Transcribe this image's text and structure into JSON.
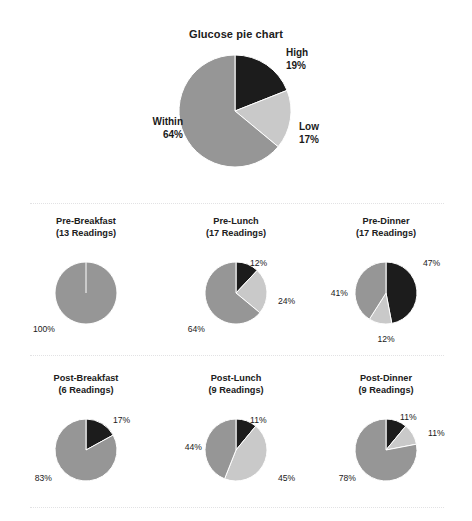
{
  "report": {
    "title": "Glucose pie chart",
    "background_color": "#ffffff",
    "divider_color": "#e2e2e4"
  },
  "palette": {
    "high": "#1c1c1c",
    "low": "#c9c9c9",
    "within": "#969696",
    "gap": "#ffffff",
    "text": "#1a1a1a"
  },
  "chart_data": [
    {
      "type": "pie",
      "id": "main",
      "title": "Glucose pie chart",
      "labels": [
        "High",
        "Low",
        "Within"
      ],
      "values": [
        19,
        17,
        64
      ],
      "value_labels": [
        "19%",
        "17%",
        "64%"
      ],
      "colors": [
        "#1c1c1c",
        "#c9c9c9",
        "#969696"
      ],
      "start_angle": 0,
      "direction": "clockwise",
      "legend": "none",
      "label_text": {
        "high": "High\n19%",
        "low": "Low\n17%",
        "within": "Within\n64%"
      }
    },
    {
      "type": "pie",
      "id": "pre-breakfast",
      "title": "Pre-Breakfast",
      "subtitle": "(13 Readings)",
      "readings": 13,
      "labels": [
        "High",
        "Low",
        "Within"
      ],
      "values": [
        0,
        0,
        100
      ],
      "value_labels": [
        "",
        "",
        "100%"
      ],
      "colors": [
        "#1c1c1c",
        "#c9c9c9",
        "#969696"
      ],
      "start_angle": 0,
      "direction": "clockwise"
    },
    {
      "type": "pie",
      "id": "pre-lunch",
      "title": "Pre-Lunch",
      "subtitle": "(17 Readings)",
      "readings": 17,
      "labels": [
        "High",
        "Low",
        "Within"
      ],
      "values": [
        12,
        24,
        64
      ],
      "value_labels": [
        "12%",
        "24%",
        "64%"
      ],
      "colors": [
        "#1c1c1c",
        "#c9c9c9",
        "#969696"
      ],
      "start_angle": 0,
      "direction": "clockwise"
    },
    {
      "type": "pie",
      "id": "pre-dinner",
      "title": "Pre-Dinner",
      "subtitle": "(17 Readings)",
      "readings": 17,
      "labels": [
        "High",
        "Low",
        "Within"
      ],
      "values": [
        47,
        12,
        41
      ],
      "value_labels": [
        "47%",
        "12%",
        "41%"
      ],
      "colors": [
        "#1c1c1c",
        "#c9c9c9",
        "#969696"
      ],
      "start_angle": 0,
      "direction": "clockwise"
    },
    {
      "type": "pie",
      "id": "post-breakfast",
      "title": "Post-Breakfast",
      "subtitle": "(6 Readings)",
      "readings": 6,
      "labels": [
        "High",
        "Low",
        "Within"
      ],
      "values": [
        17,
        0,
        83
      ],
      "value_labels": [
        "17%",
        "",
        "83%"
      ],
      "colors": [
        "#1c1c1c",
        "#c9c9c9",
        "#969696"
      ],
      "start_angle": 0,
      "direction": "clockwise"
    },
    {
      "type": "pie",
      "id": "post-lunch",
      "title": "Post-Lunch",
      "subtitle": "(9 Readings)",
      "readings": 9,
      "labels": [
        "High",
        "Low",
        "Within"
      ],
      "values": [
        11,
        45,
        44
      ],
      "value_labels": [
        "11%",
        "45%",
        "44%"
      ],
      "colors": [
        "#1c1c1c",
        "#c9c9c9",
        "#969696"
      ],
      "start_angle": 0,
      "direction": "clockwise"
    },
    {
      "type": "pie",
      "id": "post-dinner",
      "title": "Post-Dinner",
      "subtitle": "(9 Readings)",
      "readings": 9,
      "labels": [
        "High",
        "Low",
        "Within"
      ],
      "values": [
        11,
        11,
        78
      ],
      "value_labels": [
        "11%",
        "11%",
        "78%"
      ],
      "colors": [
        "#1c1c1c",
        "#c9c9c9",
        "#969696"
      ],
      "start_angle": 0,
      "direction": "clockwise"
    }
  ],
  "layout": {
    "main_pie": {
      "cx": 235,
      "cy": 111,
      "r": 56
    },
    "sub_pies": [
      {
        "id": "pre-breakfast",
        "cx": 86,
        "cy": 293,
        "r": 31,
        "title_x": 86,
        "title_y": 216
      },
      {
        "id": "pre-lunch",
        "cx": 236,
        "cy": 293,
        "r": 31,
        "title_x": 236,
        "title_y": 216
      },
      {
        "id": "pre-dinner",
        "cx": 386,
        "cy": 293,
        "r": 31,
        "title_x": 386,
        "title_y": 216
      },
      {
        "id": "post-breakfast",
        "cx": 86,
        "cy": 450,
        "r": 31,
        "title_x": 86,
        "title_y": 373
      },
      {
        "id": "post-lunch",
        "cx": 236,
        "cy": 450,
        "r": 31,
        "title_x": 236,
        "title_y": 373
      },
      {
        "id": "post-dinner",
        "cx": 386,
        "cy": 450,
        "r": 31,
        "title_x": 386,
        "title_y": 373
      }
    ],
    "main_labels": [
      {
        "key": "high",
        "text": "High\n19%",
        "x": 286,
        "y": 47,
        "align": "left"
      },
      {
        "key": "low",
        "text": "Low\n17%",
        "x": 299,
        "y": 121,
        "align": "left"
      },
      {
        "key": "within",
        "text": "Within\n64%",
        "x": 183,
        "y": 116,
        "align": "right"
      }
    ],
    "sub_labels": {
      "pre-breakfast": [
        {
          "key": "within",
          "text": "100%",
          "x": 55,
          "y": 324,
          "align": "right"
        }
      ],
      "pre-lunch": [
        {
          "key": "high",
          "text": "12%",
          "x": 250,
          "y": 258,
          "align": "left"
        },
        {
          "key": "low",
          "text": "24%",
          "x": 278,
          "y": 296,
          "align": "left"
        },
        {
          "key": "within",
          "text": "64%",
          "x": 205,
          "y": 324,
          "align": "right"
        }
      ],
      "pre-dinner": [
        {
          "key": "high",
          "text": "47%",
          "x": 423,
          "y": 258,
          "align": "left"
        },
        {
          "key": "low",
          "text": "12%",
          "x": 386,
          "y": 334,
          "align": "center"
        },
        {
          "key": "within",
          "text": "41%",
          "x": 348,
          "y": 288,
          "align": "right"
        }
      ],
      "post-breakfast": [
        {
          "key": "high",
          "text": "17%",
          "x": 113,
          "y": 415,
          "align": "left"
        },
        {
          "key": "within",
          "text": "83%",
          "x": 52,
          "y": 473,
          "align": "right"
        }
      ],
      "post-lunch": [
        {
          "key": "high",
          "text": "11%",
          "x": 250,
          "y": 415,
          "align": "left"
        },
        {
          "key": "low",
          "text": "45%",
          "x": 278,
          "y": 473,
          "align": "left"
        },
        {
          "key": "within",
          "text": "44%",
          "x": 202,
          "y": 442,
          "align": "right"
        }
      ],
      "post-dinner": [
        {
          "key": "high",
          "text": "11%",
          "x": 400,
          "y": 412,
          "align": "left"
        },
        {
          "key": "low",
          "text": "11%",
          "x": 428,
          "y": 428,
          "align": "left"
        },
        {
          "key": "within",
          "text": "78%",
          "x": 356,
          "y": 473,
          "align": "right"
        }
      ]
    }
  }
}
